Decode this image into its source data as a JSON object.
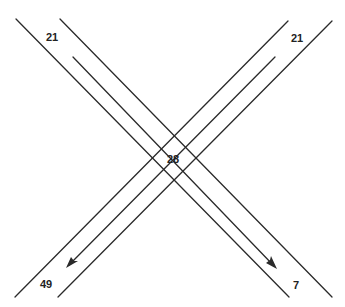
{
  "diagram": {
    "type": "intersection-traffic-flow",
    "line_color": "#2a2a2a",
    "labels": {
      "top_left": "21",
      "top_right": "21",
      "center": "28",
      "bottom_left": "49",
      "bottom_right": "7"
    },
    "flows": [
      {
        "name": "nw-to-se",
        "from": "top-left",
        "to": "bottom-right",
        "start_value": "21",
        "end_value": "7"
      },
      {
        "name": "ne-to-sw",
        "from": "top-right",
        "to": "bottom-left",
        "start_value": "21",
        "end_value": "49"
      }
    ],
    "center_value": "28"
  }
}
